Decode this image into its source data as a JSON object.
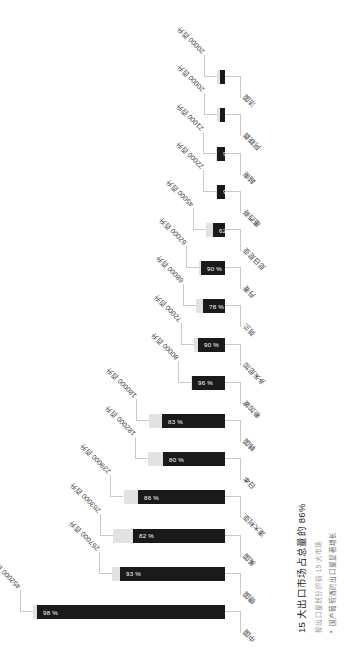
{
  "chart_data": {
    "type": "bar",
    "orientation": "horizontal",
    "title": "15 大出口市场占总量的 86%",
    "xlabel": "",
    "ylabel": "",
    "value_unit": "百升",
    "ylim": [
      0,
      452000
    ],
    "grid": false,
    "legend_position": "none",
    "categories": [
      "中国",
      "德国",
      "美国",
      "澳大利亚",
      "日本",
      "韩国",
      "新加坡",
      "多米尼加",
      "荷兰",
      "丹麦",
      "尼日尼亚",
      "墨西哥",
      "越南",
      "阿联酋",
      "法国"
    ],
    "values": [
      452000,
      267000,
      263000,
      239000,
      182000,
      180000,
      80000,
      72000,
      68000,
      62000,
      45000,
      22000,
      21000,
      20000,
      20000
    ],
    "value_labels": [
      "452000 百升",
      "267000 百升",
      "263000 百升",
      "239000 百升",
      "182000 百升",
      "180000 百升",
      "80000 百升",
      "72000 百升",
      "68000 百升",
      "62000 百升",
      "45000 百升",
      "22000 百升",
      "21000 百升",
      "20000 百升",
      "20000 百升"
    ],
    "percent_labels": [
      "98 %",
      "93 %",
      "82 %",
      "86 %",
      "80 %",
      "83 %",
      "96 %",
      "90 %",
      "78 %",
      "90 %",
      "62 %",
      "90 %",
      "93 %",
      "65 %",
      "60 %"
    ],
    "percents": [
      98,
      93,
      82,
      86,
      80,
      83,
      96,
      90,
      78,
      90,
      62,
      90,
      93,
      65,
      60
    ],
    "series": [
      {
        "name": "深色占比部分",
        "color": "#1a1a1a",
        "values": [
          442960,
          248310,
          215660,
          205540,
          145600,
          149400,
          76800,
          64800,
          53040,
          55800,
          27900,
          19800,
          19530,
          13000,
          12000
        ]
      },
      {
        "name": "浅色余量部分",
        "color": "#e2e2e2",
        "values": [
          9040,
          18690,
          47340,
          33460,
          36400,
          30600,
          3200,
          7200,
          14960,
          6200,
          17100,
          2200,
          1470,
          7000,
          8000
        ]
      }
    ]
  },
  "notes": {
    "title": "15 大出口市场占总量的 86%",
    "subtitle": "按出口量划分的前 15 大市场",
    "bullet_dot": "•",
    "bullet": "国产葡萄酒的出口量显著增长"
  },
  "colors": {
    "bar_dark": "#1a1a1a",
    "bar_light": "#e2e2e2",
    "leader": "#c9c9c9",
    "text": "#3b3b3b",
    "muted": "#9a9a9a",
    "background": "#ffffff"
  }
}
